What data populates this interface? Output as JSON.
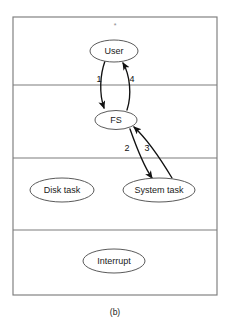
{
  "figure": {
    "caption": "(b)",
    "top_mark": "*",
    "clipped_header_text": "",
    "frame": {
      "x": 13,
      "y": 17,
      "width": 204,
      "height": 278
    },
    "band_dividers_y": [
      85,
      158,
      230
    ],
    "bands": [
      {
        "name": "user-band",
        "label": ""
      },
      {
        "name": "fs-band",
        "label": ""
      },
      {
        "name": "task-band",
        "label": ""
      },
      {
        "name": "interrupt-band",
        "label": ""
      }
    ],
    "nodes": [
      {
        "id": "user",
        "label": "User",
        "cx": 114,
        "cy": 51,
        "rx": 24,
        "ry": 11
      },
      {
        "id": "fs",
        "label": "FS",
        "cx": 116,
        "cy": 120,
        "rx": 21,
        "ry": 9.5
      },
      {
        "id": "disk-task",
        "label": "Disk task",
        "cx": 62,
        "cy": 190,
        "rx": 32,
        "ry": 12
      },
      {
        "id": "system-task",
        "label": "System task",
        "cx": 159,
        "cy": 190,
        "rx": 36,
        "ry": 12
      },
      {
        "id": "interrupt",
        "label": "Interrupt",
        "cx": 114,
        "cy": 261,
        "rx": 31,
        "ry": 12
      }
    ],
    "arrows": [
      {
        "id": "arrow-1",
        "label": "1",
        "from": "user",
        "to": "fs",
        "direction": "down",
        "label_x": 99,
        "label_y": 80
      },
      {
        "id": "arrow-4",
        "label": "4",
        "from": "fs",
        "to": "user",
        "direction": "up",
        "label_x": 132,
        "label_y": 80
      },
      {
        "id": "arrow-2",
        "label": "2",
        "from": "fs",
        "to": "system-task",
        "direction": "down",
        "label_x": 127,
        "label_y": 149
      },
      {
        "id": "arrow-3",
        "label": "3",
        "from": "system-task",
        "to": "fs",
        "direction": "up",
        "label_x": 147,
        "label_y": 149
      }
    ]
  },
  "colors": {
    "frame_stroke": "#7d7d7d",
    "node_stroke": "#5a5a5a",
    "arrow_stroke": "#111111",
    "text": "#1a1a1a",
    "background": "#ffffff"
  }
}
